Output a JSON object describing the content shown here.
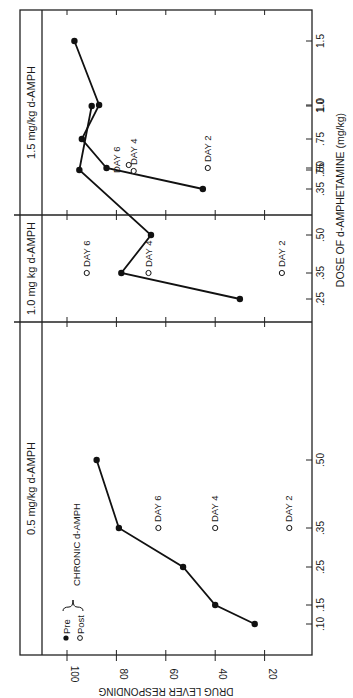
{
  "chart_data": {
    "type": "line",
    "orientation": "rotated 90 degrees clockwise",
    "ylabel": "DRUG LEVER RESPONDING",
    "xlabel": "DOSE OF d-AMPHETAMINE (mg/kg)",
    "ylim": [
      0,
      100
    ],
    "yticks": [
      100,
      80,
      60,
      40,
      20
    ],
    "legend": [
      {
        "marker": "filled-circle",
        "label": "Pre"
      },
      {
        "marker": "open-circle",
        "label": "Post"
      }
    ],
    "legend_bracket_label": "CHRONIC d-AMPH",
    "panels": [
      {
        "title": "0.5 mg/kg  d-AMPH",
        "xticks": [
          ".10",
          ".15",
          ".25",
          ".35",
          ".50"
        ],
        "pre": {
          "x": [
            0.1,
            0.15,
            0.25,
            0.35,
            0.5
          ],
          "y": [
            24,
            40,
            53,
            79,
            88
          ]
        },
        "post": [
          {
            "label": "DAY 6",
            "x": 0.35,
            "y": 63
          },
          {
            "label": "DAY 4",
            "x": 0.35,
            "y": 40
          },
          {
            "label": "DAY 2",
            "x": 0.35,
            "y": 10
          }
        ]
      },
      {
        "title": "1.0 mg kg  d-AMPH",
        "xticks": [
          ".25",
          ".35",
          ".50",
          ".75",
          "1.0"
        ],
        "pre": {
          "x": [
            0.25,
            0.35,
            0.5,
            0.75,
            1.0
          ],
          "y": [
            30,
            78,
            66,
            95,
            90
          ]
        },
        "post": [
          {
            "label": "DAY 6",
            "x": 0.35,
            "y": 92
          },
          {
            "label": "DAY 4",
            "x": 0.35,
            "y": 67
          },
          {
            "label": "DAY 2",
            "x": 0.35,
            "y": 13
          }
        ]
      },
      {
        "title": "1.5 mg/kg  d-AMPH",
        "xticks": [
          ".35",
          ".50",
          ".75",
          "1.0",
          "1.5"
        ],
        "pre": {
          "x": [
            0.35,
            0.5,
            0.75,
            1.0,
            1.5
          ],
          "y": [
            45,
            84,
            94,
            87,
            97
          ]
        },
        "post": [
          {
            "label": "DAY 6",
            "x": 0.5,
            "y": 75
          },
          {
            "label": "DAY 4",
            "x": 0.5,
            "y": 73
          },
          {
            "label": "DAY 2",
            "x": 0.5,
            "y": 43
          }
        ]
      }
    ]
  }
}
